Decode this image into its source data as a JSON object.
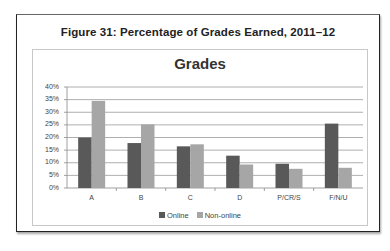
{
  "figure": {
    "title": "Figure 31: Percentage of Grades Earned, 2011–12"
  },
  "chart_data": {
    "type": "bar",
    "title": "Grades",
    "xlabel": "",
    "ylabel": "",
    "categories": [
      "A",
      "B",
      "C",
      "D",
      "P/CR/S",
      "F/N/U"
    ],
    "series": [
      {
        "name": "Online",
        "color": "#595959",
        "values": [
          20,
          17.8,
          16.5,
          12.8,
          9.6,
          25.5
        ]
      },
      {
        "name": "Non-online",
        "color": "#a6a6a6",
        "values": [
          34.5,
          25.2,
          17.3,
          9.3,
          7.6,
          8.0
        ]
      }
    ],
    "yticks": [
      "0%",
      "5%",
      "10%",
      "15%",
      "20%",
      "25%",
      "30%",
      "35%",
      "40%"
    ],
    "ylim": [
      0,
      40
    ],
    "grid": true,
    "legend_position": "bottom"
  }
}
